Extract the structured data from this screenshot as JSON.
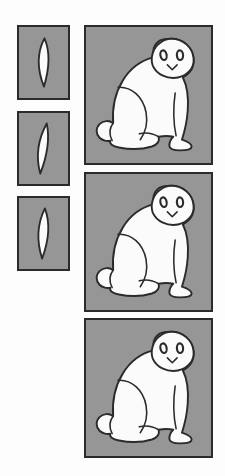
{
  "figure": {
    "background_color": "#fdfdfd",
    "panel_fill_color": "#969696",
    "panel_border_color": "#2b2b2b",
    "shape_fill_color": "#fbfbfb",
    "columns": [
      {
        "name": "left-column",
        "role": "cross-section-column",
        "panel_count": 3,
        "panels": [
          {
            "index": 1,
            "label": "small-panel-1",
            "shape": "lens-leaf",
            "shape_orientation": "vertical",
            "x": 17,
            "y": 25,
            "width": 53,
            "height": 75
          },
          {
            "index": 2,
            "label": "small-panel-2",
            "shape": "lens-leaf",
            "shape_orientation": "vertical-slanted",
            "x": 17,
            "y": 111,
            "width": 53,
            "height": 75
          },
          {
            "index": 3,
            "label": "small-panel-3",
            "shape": "lens-leaf",
            "shape_orientation": "vertical",
            "x": 17,
            "y": 196,
            "width": 53,
            "height": 75
          }
        ]
      },
      {
        "name": "right-column",
        "role": "cat-figure-column",
        "panel_count": 3,
        "panels": [
          {
            "index": 1,
            "label": "cat-panel-1",
            "subject": "sitting-cat",
            "facing": "right",
            "x": 84,
            "y": 25,
            "width": 129,
            "height": 140
          },
          {
            "index": 2,
            "label": "cat-panel-2",
            "subject": "sitting-cat",
            "facing": "right",
            "x": 84,
            "y": 172,
            "width": 129,
            "height": 140
          },
          {
            "index": 3,
            "label": "cat-panel-3",
            "subject": "sitting-cat",
            "facing": "right",
            "x": 84,
            "y": 318,
            "width": 129,
            "height": 140
          }
        ]
      }
    ],
    "cat_features": [
      "head",
      "left-eye",
      "right-eye",
      "nose-mouth",
      "body",
      "haunch-curve",
      "tail",
      "front-leg",
      "front-paw",
      "hind-paw"
    ]
  }
}
